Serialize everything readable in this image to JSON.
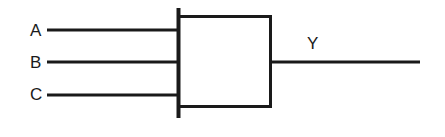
{
  "diagram": {
    "type": "logic-gate-symbol",
    "background_color": "#ffffff",
    "line_color": "#1a1a1a",
    "canvas": {
      "width": 445,
      "height": 137
    },
    "gate_body": {
      "left_bar_x": 178,
      "left_bar_y_top": 8,
      "left_bar_y_bottom": 118,
      "box_left": 178,
      "box_top": 15,
      "box_right": 272,
      "box_bottom": 108
    },
    "inputs": [
      {
        "label": "A",
        "wire_y": 30,
        "wire_x_start": 47,
        "wire_x_end": 178
      },
      {
        "label": "B",
        "wire_y": 62,
        "wire_x_start": 47,
        "wire_x_end": 178
      },
      {
        "label": "C",
        "wire_y": 95,
        "wire_x_start": 47,
        "wire_x_end": 178
      }
    ],
    "outputs": [
      {
        "label": "Y",
        "wire_y": 62,
        "wire_x_start": 272,
        "wire_x_end": 420
      }
    ]
  }
}
